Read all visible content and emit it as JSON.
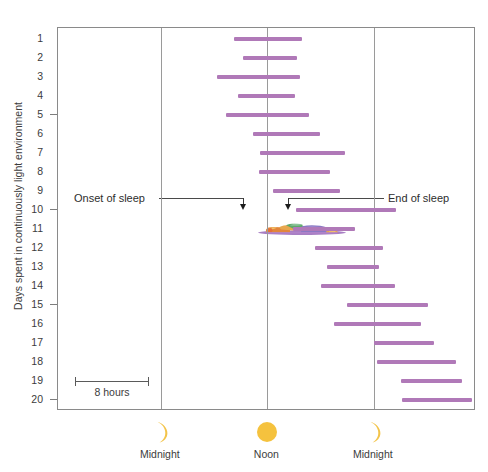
{
  "chart_data": {
    "type": "bar",
    "orientation": "horizontal-range",
    "title": "",
    "subtitle": "",
    "xlabel": "",
    "ylabel": "Days spent in continuously light environment",
    "xlim_hours": [
      -11.6,
      35.5
    ],
    "x_tick_positions_hours": [
      0,
      12,
      24
    ],
    "x_tick_labels": [
      "Midnight",
      "Noon",
      "Midnight"
    ],
    "x_tick_icons": [
      "crescent-moon",
      "sun",
      "crescent-moon"
    ],
    "ylim": [
      0.4,
      20.6
    ],
    "y_tick_labels": [
      "1",
      "2",
      "3",
      "4",
      "5",
      "6",
      "7",
      "8",
      "9",
      "10",
      "11",
      "12",
      "13",
      "14",
      "15",
      "16",
      "17",
      "18",
      "19",
      "20"
    ],
    "y_major_ticks": [
      5,
      10,
      15,
      20
    ],
    "grid": "vertical-only",
    "legend": "none",
    "bar_color": "#b079b8",
    "scale_bar": {
      "label": "8 hours",
      "hours": 8
    },
    "annotations": [
      {
        "name": "onset-of-sleep",
        "label": "Onset of sleep",
        "points_to_day": 10,
        "points_to_hour": 4.2
      },
      {
        "name": "end-of-sleep",
        "label": "End of sleep",
        "points_to_day": 10,
        "points_to_hour": 15.4
      }
    ],
    "illustration": {
      "name": "sleeping-person",
      "day": 10
    },
    "categories": [
      "1",
      "2",
      "3",
      "4",
      "5",
      "6",
      "7",
      "8",
      "9",
      "10",
      "11",
      "12",
      "13",
      "14",
      "15",
      "16",
      "17",
      "18",
      "19",
      "20"
    ],
    "series": [
      {
        "name": "Sleep episode (hours from first midnight)",
        "bars": [
          {
            "day": 1,
            "start_hour": 8.2,
            "end_hour": 15.9
          },
          {
            "day": 2,
            "start_hour": 9.2,
            "end_hour": 15.3
          },
          {
            "day": 3,
            "start_hour": 6.3,
            "end_hour": 15.7
          },
          {
            "day": 4,
            "start_hour": 8.7,
            "end_hour": 15.1
          },
          {
            "day": 5,
            "start_hour": 7.3,
            "end_hour": 16.7
          },
          {
            "day": 6,
            "start_hour": 10.4,
            "end_hour": 17.9
          },
          {
            "day": 7,
            "start_hour": 11.2,
            "end_hour": 20.8
          },
          {
            "day": 8,
            "start_hour": 11.0,
            "end_hour": 19.1
          },
          {
            "day": 9,
            "start_hour": 12.6,
            "end_hour": 20.2
          },
          {
            "day": 10,
            "start_hour": 15.2,
            "end_hour": 26.5
          },
          {
            "day": 11,
            "start_hour": 14.9,
            "end_hour": 21.9
          },
          {
            "day": 12,
            "start_hour": 17.4,
            "end_hour": 25.0
          },
          {
            "day": 13,
            "start_hour": 18.7,
            "end_hour": 24.6
          },
          {
            "day": 14,
            "start_hour": 18.0,
            "end_hour": 26.4
          },
          {
            "day": 15,
            "start_hour": 21.0,
            "end_hour": 30.1
          },
          {
            "day": 16,
            "start_hour": 19.5,
            "end_hour": 29.3
          },
          {
            "day": 17,
            "start_hour": 24.0,
            "end_hour": 30.8
          },
          {
            "day": 18,
            "start_hour": 24.3,
            "end_hour": 33.2
          },
          {
            "day": 19,
            "start_hour": 27.0,
            "end_hour": 33.9
          },
          {
            "day": 20,
            "start_hour": 27.1,
            "end_hour": 35.0
          }
        ]
      }
    ]
  },
  "axis": {
    "y_title": "Days spent in continuously light environment",
    "bottom_items": [
      {
        "label": "Midnight",
        "icon": "crescent-moon-icon"
      },
      {
        "label": "Noon",
        "icon": "sun-icon"
      },
      {
        "label": "Midnight",
        "icon": "crescent-moon-icon"
      }
    ]
  },
  "annotations": {
    "onset_label": "Onset of sleep",
    "end_label": "End of sleep"
  },
  "scale": {
    "label": "8 hours"
  },
  "colors": {
    "bar": "#b079b8",
    "sun": "#f5c23e",
    "moon": "#f3c44a",
    "frame": "#8a8a8a",
    "grid": "#9a9a9a",
    "text": "#3c3c3c"
  }
}
